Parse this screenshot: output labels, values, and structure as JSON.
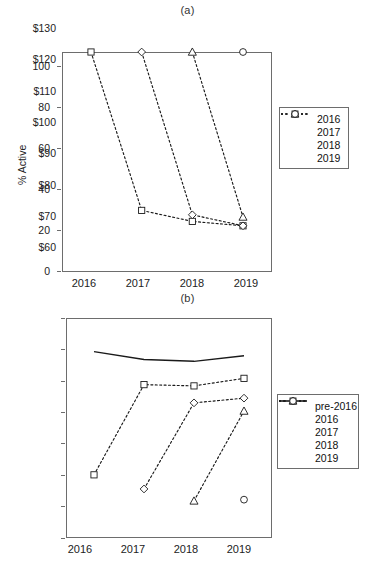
{
  "figure": {
    "panel_a_title": "(a)",
    "panel_b_title": "(b)"
  },
  "chart_data": [
    {
      "type": "line",
      "title": "(a)",
      "xlabel": "",
      "ylabel": "% Active",
      "x": [
        "2016",
        "2017",
        "2018",
        "2019"
      ],
      "xlim": [
        "2016",
        "2019"
      ],
      "ylim": [
        0,
        100
      ],
      "yticks": [
        0,
        20,
        40,
        60,
        80,
        100
      ],
      "ytick_labels": [
        "0",
        "20",
        "40",
        "60",
        "80",
        "100"
      ],
      "grid": false,
      "legend_position": "right",
      "series": [
        {
          "name": "2016",
          "marker": "square",
          "x": [
            "2016",
            "2017",
            "2018",
            "2019"
          ],
          "values": [
            100,
            28,
            23,
            21
          ]
        },
        {
          "name": "2017",
          "marker": "diamond",
          "x": [
            "2017",
            "2018",
            "2019"
          ],
          "values": [
            100,
            26,
            21
          ]
        },
        {
          "name": "2018",
          "marker": "triangle",
          "x": [
            "2018",
            "2019"
          ],
          "values": [
            100,
            25
          ]
        },
        {
          "name": "2019",
          "marker": "circle",
          "x": [
            "2019"
          ],
          "values": [
            100
          ]
        }
      ]
    },
    {
      "type": "line",
      "title": "(b)",
      "xlabel": "",
      "ylabel": "Avg profit / active cohort member",
      "x": [
        "2016",
        "2017",
        "2018",
        "2019"
      ],
      "xlim": [
        "2016",
        "2019"
      ],
      "ylim": [
        60,
        130
      ],
      "yticks": [
        60,
        70,
        80,
        90,
        100,
        110,
        120,
        130
      ],
      "ytick_labels": [
        "$60",
        "$70",
        "$80",
        "$90",
        "$100",
        "$110",
        "$120",
        "$130"
      ],
      "grid": false,
      "legend_position": "right",
      "series": [
        {
          "name": "pre-2016",
          "marker": "none",
          "x": [
            "2016",
            "2017",
            "2018",
            "2019"
          ],
          "values": [
            119.3,
            116.8,
            116.2,
            118.0
          ]
        },
        {
          "name": "2016",
          "marker": "square",
          "x": [
            "2016",
            "2017",
            "2018",
            "2019"
          ],
          "values": [
            80.1,
            108.8,
            108.4,
            110.8
          ]
        },
        {
          "name": "2017",
          "marker": "diamond",
          "x": [
            "2017",
            "2018",
            "2019"
          ],
          "values": [
            75.6,
            103.0,
            104.5
          ]
        },
        {
          "name": "2018",
          "marker": "triangle",
          "x": [
            "2018",
            "2019"
          ],
          "values": [
            71.8,
            100.4
          ]
        },
        {
          "name": "2019",
          "marker": "circle",
          "x": [
            "2019"
          ],
          "values": [
            72.2
          ]
        }
      ]
    }
  ],
  "panel_a": {
    "title": "(a)",
    "y_axis_title": "% Active",
    "y_tick_labels": [
      "100",
      "80",
      "60",
      "40",
      "20",
      "0"
    ],
    "x_tick_labels": [
      "2016",
      "2017",
      "2018",
      "2019"
    ],
    "legend": [
      {
        "label": "2016",
        "marker": "square"
      },
      {
        "label": "2017",
        "marker": "diamond"
      },
      {
        "label": "2018",
        "marker": "triangle"
      },
      {
        "label": "2019",
        "marker": "circle"
      }
    ]
  },
  "panel_b": {
    "title": "(b)",
    "y_axis_title": "Avg profit / active cohort member",
    "y_tick_labels": [
      "$130",
      "$120",
      "$110",
      "$100",
      "$90",
      "$80",
      "$70",
      "$60"
    ],
    "x_tick_labels": [
      "2016",
      "2017",
      "2018",
      "2019"
    ],
    "legend": [
      {
        "label": "pre-2016",
        "marker": "line"
      },
      {
        "label": "2016",
        "marker": "square"
      },
      {
        "label": "2017",
        "marker": "diamond"
      },
      {
        "label": "2018",
        "marker": "triangle"
      },
      {
        "label": "2019",
        "marker": "circle"
      }
    ]
  },
  "colors": {
    "axis": "#6d6d6d",
    "series": "#1a1a1a",
    "background": "#ffffff"
  }
}
